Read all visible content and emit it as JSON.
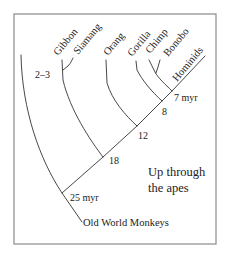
{
  "diagram": {
    "type": "phylogenetic-tree",
    "title": "Up through the apes",
    "title_lines": [
      "Up through",
      "the apes"
    ],
    "colors": {
      "line": "#333333",
      "frame": "#8a8a8a",
      "text": "#222222",
      "background": "#ffffff"
    },
    "taxa": [
      {
        "id": "gibbon",
        "label": "Gibbon"
      },
      {
        "id": "siamang",
        "label": "Siamang"
      },
      {
        "id": "orang",
        "label": "Orang"
      },
      {
        "id": "gorilla",
        "label": "Gorilla"
      },
      {
        "id": "chimp",
        "label": "Chimp"
      },
      {
        "id": "bonobo",
        "label": "Bonobo"
      },
      {
        "id": "hominids",
        "label": "Hominids"
      },
      {
        "id": "owm",
        "label": "Old World Monkeys"
      }
    ],
    "nodes": [
      {
        "id": "n25",
        "label": "25 myr",
        "joins": [
          "owm",
          "apes"
        ]
      },
      {
        "id": "n18",
        "label": "18",
        "joins": [
          "gibbons",
          "great-apes"
        ]
      },
      {
        "id": "n12",
        "label": "12",
        "joins": [
          "orang",
          "african-apes"
        ]
      },
      {
        "id": "n8",
        "label": "8",
        "joins": [
          "gorilla",
          "chimps-hominids"
        ]
      },
      {
        "id": "n7",
        "label": "7 myr",
        "joins": [
          "chimps",
          "hominids"
        ]
      },
      {
        "id": "n23",
        "label": "2–3",
        "joins": [
          "gibbon",
          "siamang"
        ]
      }
    ]
  }
}
